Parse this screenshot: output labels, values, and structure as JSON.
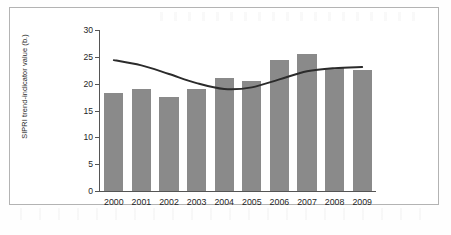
{
  "chart_data": {
    "type": "bar",
    "title": "",
    "xlabel": "",
    "ylabel": "SIPRI trend-indicator value (b.)",
    "categories": [
      "2000",
      "2001",
      "2002",
      "2003",
      "2004",
      "2005",
      "2006",
      "2007",
      "2008",
      "2009"
    ],
    "values": [
      18.2,
      19.1,
      17.5,
      19.0,
      21.0,
      20.5,
      24.5,
      25.5,
      23.0,
      22.6
    ],
    "ylim": [
      0,
      30
    ],
    "yticks": [
      "0",
      "5",
      "10",
      "15",
      "20",
      "25",
      "30"
    ],
    "ytick_values": [
      0,
      5,
      10,
      15,
      20,
      25,
      30
    ],
    "grid": false,
    "legend": "none",
    "series": [
      {
        "name": "SIPRI trend-indicator value",
        "type": "bar",
        "color": "#8a8a8a",
        "values": [
          18.2,
          19.1,
          17.5,
          19.0,
          21.0,
          20.5,
          24.5,
          25.5,
          23.0,
          22.6
        ]
      },
      {
        "name": "trend line",
        "type": "line",
        "color": "#2b2b2b",
        "values": [
          24.4,
          23.4,
          21.8,
          20.1,
          19.0,
          19.3,
          20.8,
          22.3,
          22.9,
          23.1
        ]
      }
    ]
  },
  "colors": {
    "bar": "#8a8a8a",
    "trend_line": "#2b2b2b",
    "axis": "#555555",
    "frame_border": "#b3b3b3",
    "background": "#ffffff",
    "text": "#1f1f1f"
  }
}
